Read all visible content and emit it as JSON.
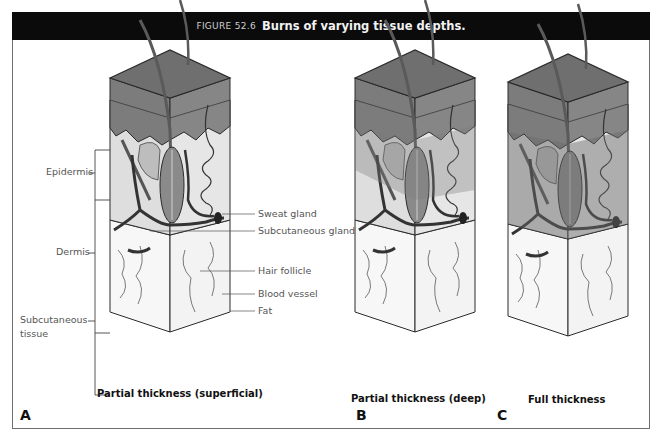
{
  "figure": {
    "number": "FIGURE 52.6",
    "title": "Burns of varying tissue depths."
  },
  "layer_labels": {
    "epidermis": "Epidermis",
    "dermis": "Dermis",
    "subcutaneous_line1": "Subcutaneous",
    "subcutaneous_line2": "tissue"
  },
  "structure_labels": {
    "sweat_gland": "Sweat gland",
    "subcutaneous_gland": "Subcutaneous gland",
    "hair_follicle": "Hair follicle",
    "blood_vessel": "Blood vessel",
    "fat": "Fat"
  },
  "panels": [
    {
      "letter": "A",
      "caption": "Partial thickness (superficial)"
    },
    {
      "letter": "B",
      "caption": "Partial thickness (deep)"
    },
    {
      "letter": "C",
      "caption": "Full thickness"
    }
  ],
  "colors": {
    "header_bg": "#0b0b0b",
    "epidermis_top": "#6f6f6f",
    "epidermis_side": "#7c7c7c",
    "dermis": "#dcdcdc",
    "burn_shade": "#9a9a9a",
    "fat": "#f7f7f7",
    "outline": "#2a2a2a"
  }
}
